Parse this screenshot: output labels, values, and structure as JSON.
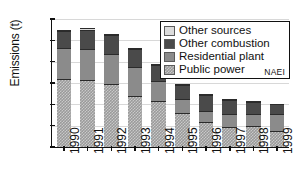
{
  "chart_data": {
    "type": "bar",
    "title": "",
    "subtitle": "",
    "xlabel": "",
    "ylabel": "Emissions (t)",
    "ylim": [
      0,
      120
    ],
    "yticks": [
      0,
      20,
      40,
      60,
      80,
      100,
      120
    ],
    "grid": true,
    "stacked": true,
    "legend_position": "top-right",
    "annotations": [
      "NAEI"
    ],
    "categories": [
      "1990",
      "1991",
      "1992",
      "1993",
      "1994",
      "1995",
      "1996",
      "1997",
      "1998",
      "1999"
    ],
    "series": [
      {
        "name": "Public power",
        "color": "#9a9a9a",
        "pattern": "checkered",
        "values": [
          64,
          63,
          59,
          48,
          43,
          32,
          23,
          19,
          20,
          15
        ]
      },
      {
        "name": "Residential plant",
        "color": "#8b8b8b",
        "pattern": "solid",
        "values": [
          29,
          29,
          28,
          27,
          19,
          13,
          11,
          12,
          11,
          16
        ]
      },
      {
        "name": "Other combustion",
        "color": "#4a4a4a",
        "pattern": "solid",
        "values": [
          16,
          18,
          18,
          17,
          15,
          13,
          15,
          13,
          11,
          9
        ]
      },
      {
        "name": "Other sources",
        "color": "#dcdcdc",
        "pattern": "solid",
        "values": [
          1,
          2,
          1,
          1,
          1,
          1,
          1,
          1,
          1,
          0.5
        ]
      }
    ],
    "totals": [
      110,
      112,
      106,
      93,
      78,
      59,
      50,
      45,
      43,
      40.5
    ]
  },
  "legend": {
    "items": [
      {
        "label": "Other sources",
        "swatch": "other-sources"
      },
      {
        "label": "Other combustion",
        "swatch": "other-combustion"
      },
      {
        "label": "Residential plant",
        "swatch": "residential-plant"
      },
      {
        "label": "Public power",
        "swatch": "public-power"
      }
    ],
    "watermark": "NAEI"
  }
}
